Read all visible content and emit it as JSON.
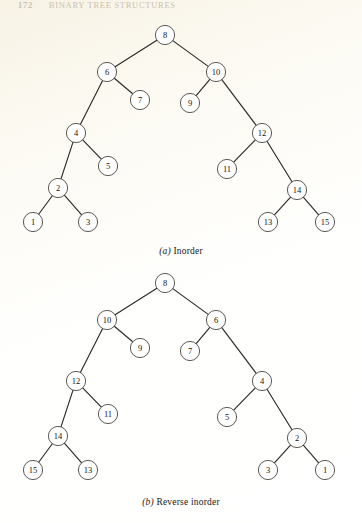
{
  "running_head": {
    "folio": "172",
    "title": "BINARY TREE STRUCTURES"
  },
  "figure": {
    "node_radius": 9.6,
    "panels": [
      {
        "id": "inorder",
        "caption_label": "(a)",
        "caption_text": "Inorder",
        "nodes": [
          {
            "id": "a8",
            "label": "8",
            "x": 165,
            "y": 35
          },
          {
            "id": "a6",
            "label": "6",
            "x": 107,
            "y": 72
          },
          {
            "id": "a10",
            "label": "10",
            "x": 216,
            "y": 72
          },
          {
            "id": "a4",
            "label": "4",
            "x": 76,
            "y": 133
          },
          {
            "id": "a7",
            "label": "7",
            "x": 140,
            "y": 100
          },
          {
            "id": "a9",
            "label": "9",
            "x": 190,
            "y": 103
          },
          {
            "id": "a12",
            "label": "12",
            "x": 262,
            "y": 133
          },
          {
            "id": "a2",
            "label": "2",
            "x": 58,
            "y": 188
          },
          {
            "id": "a5",
            "label": "5",
            "x": 108,
            "y": 166
          },
          {
            "id": "a11",
            "label": "11",
            "x": 227,
            "y": 169
          },
          {
            "id": "a14",
            "label": "14",
            "x": 297,
            "y": 190
          },
          {
            "id": "a1",
            "label": "1",
            "x": 33,
            "y": 222
          },
          {
            "id": "a3",
            "label": "3",
            "x": 88,
            "y": 222
          },
          {
            "id": "a13",
            "label": "13",
            "x": 268,
            "y": 222
          },
          {
            "id": "a15",
            "label": "15",
            "x": 325,
            "y": 222
          }
        ],
        "edges": [
          [
            "a8",
            "a6"
          ],
          [
            "a8",
            "a10"
          ],
          [
            "a6",
            "a4"
          ],
          [
            "a6",
            "a7"
          ],
          [
            "a10",
            "a9"
          ],
          [
            "a10",
            "a12"
          ],
          [
            "a4",
            "a2"
          ],
          [
            "a4",
            "a5"
          ],
          [
            "a12",
            "a11"
          ],
          [
            "a12",
            "a14"
          ],
          [
            "a2",
            "a1"
          ],
          [
            "a2",
            "a3"
          ],
          [
            "a14",
            "a13"
          ],
          [
            "a14",
            "a15"
          ]
        ]
      },
      {
        "id": "reverse-inorder",
        "caption_label": "(b)",
        "caption_text": "Reverse inorder",
        "nodes": [
          {
            "id": "b8",
            "label": "8",
            "x": 165,
            "y": 283
          },
          {
            "id": "b10",
            "label": "10",
            "x": 107,
            "y": 320
          },
          {
            "id": "b6",
            "label": "6",
            "x": 216,
            "y": 320
          },
          {
            "id": "b12",
            "label": "12",
            "x": 76,
            "y": 381
          },
          {
            "id": "b9",
            "label": "9",
            "x": 140,
            "y": 348
          },
          {
            "id": "b7",
            "label": "7",
            "x": 190,
            "y": 351
          },
          {
            "id": "b4",
            "label": "4",
            "x": 262,
            "y": 381
          },
          {
            "id": "b14",
            "label": "14",
            "x": 58,
            "y": 436
          },
          {
            "id": "b11",
            "label": "11",
            "x": 108,
            "y": 414
          },
          {
            "id": "b5",
            "label": "5",
            "x": 227,
            "y": 417
          },
          {
            "id": "b2",
            "label": "2",
            "x": 297,
            "y": 438
          },
          {
            "id": "b15",
            "label": "15",
            "x": 33,
            "y": 470
          },
          {
            "id": "b13",
            "label": "13",
            "x": 88,
            "y": 470
          },
          {
            "id": "b3",
            "label": "3",
            "x": 268,
            "y": 470
          },
          {
            "id": "b1",
            "label": "1",
            "x": 325,
            "y": 470
          }
        ],
        "edges": [
          [
            "b8",
            "b10"
          ],
          [
            "b8",
            "b6"
          ],
          [
            "b10",
            "b12"
          ],
          [
            "b10",
            "b9"
          ],
          [
            "b6",
            "b7"
          ],
          [
            "b6",
            "b4"
          ],
          [
            "b12",
            "b14"
          ],
          [
            "b12",
            "b11"
          ],
          [
            "b4",
            "b5"
          ],
          [
            "b4",
            "b2"
          ],
          [
            "b14",
            "b15"
          ],
          [
            "b14",
            "b13"
          ],
          [
            "b2",
            "b3"
          ],
          [
            "b2",
            "b1"
          ]
        ]
      }
    ]
  },
  "chart_data": {
    "type": "diagram",
    "diagram_type": "binary-tree-pair",
    "trees": [
      {
        "name": "(a) Inorder",
        "root": "8",
        "adjacency": {
          "8": [
            "6",
            "10"
          ],
          "6": [
            "4",
            "7"
          ],
          "4": [
            "2",
            "5"
          ],
          "2": [
            "1",
            "3"
          ],
          "10": [
            "9",
            "12"
          ],
          "12": [
            "11",
            "14"
          ],
          "14": [
            "13",
            "15"
          ]
        },
        "leaves": [
          "1",
          "3",
          "5",
          "7",
          "9",
          "11",
          "13",
          "15"
        ],
        "depth": 5,
        "node_count": 15
      },
      {
        "name": "(b) Reverse inorder",
        "root": "8",
        "adjacency": {
          "8": [
            "10",
            "6"
          ],
          "10": [
            "12",
            "9"
          ],
          "12": [
            "14",
            "11"
          ],
          "14": [
            "15",
            "13"
          ],
          "6": [
            "7",
            "4"
          ],
          "4": [
            "5",
            "2"
          ],
          "2": [
            "3",
            "1"
          ]
        },
        "leaves": [
          "15",
          "13",
          "11",
          "9",
          "7",
          "5",
          "3",
          "1"
        ],
        "depth": 5,
        "node_count": 15
      }
    ],
    "note": "Tree (b) is the exact left-right mirror image of tree (a)."
  }
}
